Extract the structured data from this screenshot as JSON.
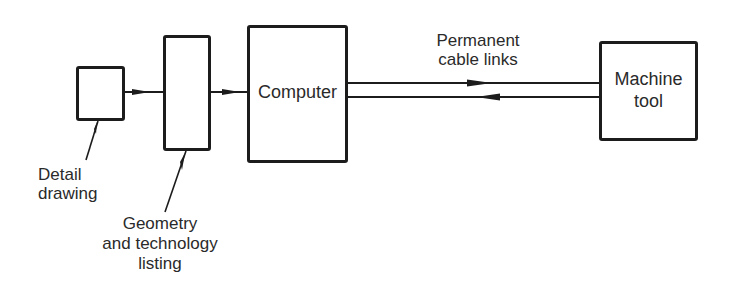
{
  "diagram": {
    "nodes": {
      "detail_drawing_box": {
        "label": ""
      },
      "listing_box": {
        "label": ""
      },
      "computer": {
        "label": "Computer"
      },
      "machine_tool": {
        "label_line1": "Machine",
        "label_line2": "tool"
      }
    },
    "annotations": {
      "detail_drawing": {
        "line1": "Detail",
        "line2": "drawing"
      },
      "listing": {
        "line1": "Geometry",
        "line2": "and technology",
        "line3": "listing"
      },
      "cable": {
        "line1": "Permanent",
        "line2": "cable links"
      }
    },
    "edges": [
      {
        "from": "detail_drawing_box",
        "to": "listing_box",
        "direction": "right"
      },
      {
        "from": "listing_box",
        "to": "computer",
        "direction": "right"
      },
      {
        "from": "computer",
        "to": "machine_tool",
        "direction": "right",
        "label": "Permanent cable links"
      },
      {
        "from": "machine_tool",
        "to": "computer",
        "direction": "left"
      }
    ],
    "colors": {
      "stroke": "#1c1c1c",
      "text": "#2a2a2a",
      "background": "#ffffff"
    }
  }
}
